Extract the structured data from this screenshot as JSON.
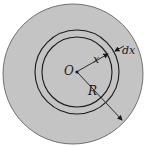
{
  "diagram": {
    "type": "annular-ring-on-disk",
    "labels": {
      "center": "O",
      "radius_small": "x",
      "thickness": "dx",
      "radius_outer": "R"
    },
    "colors": {
      "disk_fill": "#c4c4c4",
      "stroke": "#1a1a1a",
      "background": "#ffffff"
    }
  }
}
